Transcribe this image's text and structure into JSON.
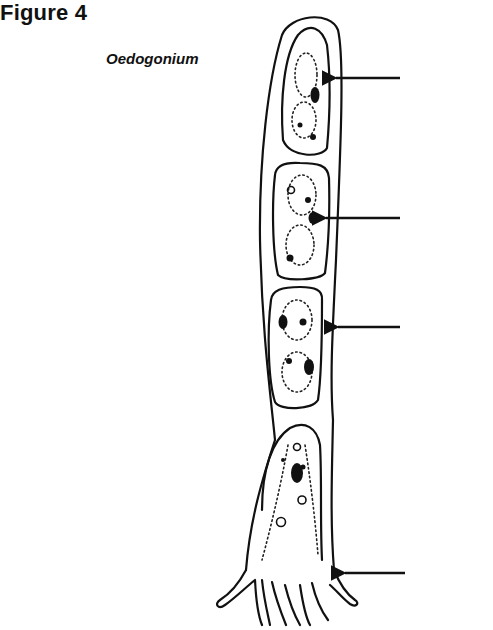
{
  "figure": {
    "title": "Figure 4",
    "subtitle": "Oedogonium",
    "ink_color": "#111111",
    "background_color": "#ffffff"
  },
  "diagram": {
    "cells": [
      {
        "id": "apical-cell",
        "position": "top",
        "has_arrow": true
      },
      {
        "id": "second-cell",
        "position": "upper-middle",
        "has_arrow": true
      },
      {
        "id": "third-cell",
        "position": "lower-middle",
        "has_arrow": true
      },
      {
        "id": "basal-holdfast-cell",
        "position": "bottom",
        "has_arrow": true
      }
    ],
    "arrows": [
      {
        "id": "arrow-1",
        "points_to": "apical cell chloroplast / nucleus region",
        "label": ""
      },
      {
        "id": "arrow-2",
        "points_to": "second cell nucleus",
        "label": ""
      },
      {
        "id": "arrow-3",
        "points_to": "third cell wall",
        "label": ""
      },
      {
        "id": "arrow-4",
        "points_to": "holdfast cell",
        "label": ""
      }
    ]
  }
}
